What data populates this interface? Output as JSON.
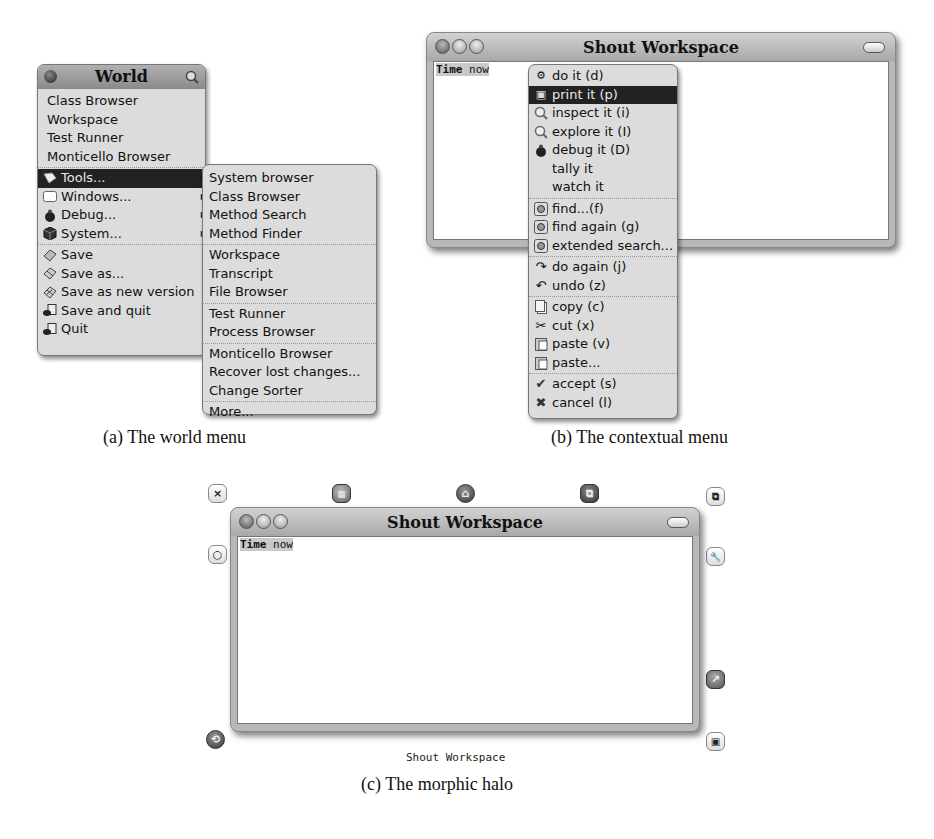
{
  "world_menu": {
    "title": "World",
    "items": [
      {
        "label": "Class Browser",
        "icon": ""
      },
      {
        "label": "Workspace",
        "icon": ""
      },
      {
        "label": "Test Runner",
        "icon": ""
      },
      {
        "label": "Monticello Browser",
        "icon": ""
      }
    ],
    "submenus": [
      {
        "label": "Tools...",
        "icon": "tools-icon",
        "selected": true
      },
      {
        "label": "Windows...",
        "icon": "window-icon"
      },
      {
        "label": "Debug...",
        "icon": "bug-icon"
      },
      {
        "label": "System...",
        "icon": "system-icon"
      }
    ],
    "actions": [
      {
        "label": "Save",
        "icon": "save-icon"
      },
      {
        "label": "Save as...",
        "icon": "save-as-icon"
      },
      {
        "label": "Save as new version",
        "icon": "save-new-version-icon"
      },
      {
        "label": "Save and quit",
        "icon": "save-quit-icon"
      },
      {
        "label": "Quit",
        "icon": "quit-icon"
      }
    ]
  },
  "tools_submenu": {
    "groups": [
      [
        "System browser",
        "Class Browser",
        "Method Search",
        "Method Finder"
      ],
      [
        "Workspace",
        "Transcript",
        "File Browser"
      ],
      [
        "Test Runner",
        "Process Browser"
      ],
      [
        "Monticello Browser",
        "Recover lost changes...",
        "Change Sorter"
      ],
      [
        "More..."
      ]
    ]
  },
  "context_window": {
    "title": "Shout Workspace",
    "code_keyword": "Time",
    "code_rest": " now"
  },
  "context_menu": {
    "groups": [
      [
        {
          "label": "do it (d)",
          "icon": "gear-icon"
        },
        {
          "label": "print it (p)",
          "icon": "print-icon",
          "selected": true
        },
        {
          "label": "inspect it (i)",
          "icon": "magnifier-icon"
        },
        {
          "label": "explore it (I)",
          "icon": "magnifier-icon"
        },
        {
          "label": "debug it (D)",
          "icon": "bug-icon"
        },
        {
          "label": "tally it",
          "icon": ""
        },
        {
          "label": "watch it",
          "icon": ""
        }
      ],
      [
        {
          "label": "find...(f)",
          "icon": "find-icon"
        },
        {
          "label": "find again (g)",
          "icon": "find-icon"
        },
        {
          "label": "extended search...",
          "icon": "find-icon"
        }
      ],
      [
        {
          "label": "do again (j)",
          "icon": "redo-icon"
        },
        {
          "label": "undo (z)",
          "icon": "undo-icon"
        }
      ],
      [
        {
          "label": "copy (c)",
          "icon": "copy-icon"
        },
        {
          "label": "cut (x)",
          "icon": "scissors-icon"
        },
        {
          "label": "paste (v)",
          "icon": "paste-icon"
        },
        {
          "label": "paste...",
          "icon": "paste-icon"
        }
      ],
      [
        {
          "label": "accept (s)",
          "icon": "check-icon"
        },
        {
          "label": "cancel (l)",
          "icon": "cancel-icon"
        }
      ]
    ]
  },
  "halo_window": {
    "title": "Shout Workspace",
    "code_keyword": "Time",
    "code_rest": " now",
    "name_label": "Shout Workspace",
    "handles": {
      "close": "×",
      "collapse": "○",
      "menu": "▦",
      "grab": "⌂",
      "drag": "⧉",
      "duplicate": "⧉",
      "debug": "🔧",
      "color": "↗",
      "resize": "▣",
      "rotate": "⟲"
    }
  },
  "captions": {
    "a": "(a)  The world menu",
    "b": "(b)  The contextual menu",
    "c": "(c)  The morphic halo"
  }
}
